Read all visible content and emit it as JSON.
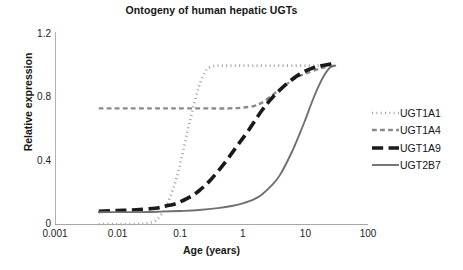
{
  "chart_data": {
    "type": "line",
    "title": "Ontogeny of human hepatic UGTs",
    "xlabel": "Age (years)",
    "ylabel": "Relative expression",
    "xscale": "log",
    "xlim": [
      0.001,
      100
    ],
    "ylim": [
      0,
      1.2
    ],
    "xticks": [
      "0.001",
      "0.01",
      "0.1",
      "1",
      "10",
      "100"
    ],
    "xtick_values": [
      0.001,
      0.01,
      0.1,
      1,
      10,
      100
    ],
    "yticks": [
      "0",
      "0.4",
      "0.8",
      "1.2"
    ],
    "ytick_values": [
      0,
      0.4,
      0.8,
      1.2
    ],
    "grid": false,
    "legend_position": "right",
    "series": [
      {
        "name": "UGT1A1",
        "style": "dotted",
        "color": "#a8a8a8",
        "width": 2.6,
        "x": [
          0.005,
          0.01,
          0.02,
          0.03,
          0.04,
          0.05,
          0.06,
          0.08,
          0.1,
          0.13,
          0.16,
          0.2,
          0.25,
          0.3,
          0.4,
          0.6,
          1,
          2,
          4,
          10,
          20,
          30
        ],
        "y": [
          0.0,
          0.0,
          0.0,
          0.005,
          0.02,
          0.06,
          0.11,
          0.24,
          0.38,
          0.58,
          0.73,
          0.87,
          0.96,
          0.99,
          1.0,
          1.0,
          1.0,
          1.0,
          1.0,
          1.0,
          1.0,
          1.0
        ]
      },
      {
        "name": "UGT1A4",
        "style": "dashed",
        "color": "#8a8a8a",
        "width": 2.4,
        "x": [
          0.005,
          0.01,
          0.05,
          0.1,
          0.3,
          0.6,
          1,
          1.5,
          2,
          3,
          4,
          6,
          8,
          10,
          15,
          20,
          30
        ],
        "y": [
          0.73,
          0.73,
          0.73,
          0.73,
          0.73,
          0.73,
          0.735,
          0.745,
          0.765,
          0.815,
          0.855,
          0.905,
          0.935,
          0.95,
          0.975,
          0.99,
          1.0
        ]
      },
      {
        "name": "UGT1A9",
        "style": "longdash",
        "color": "#1a1a1a",
        "width": 3.6,
        "x": [
          0.005,
          0.01,
          0.02,
          0.04,
          0.06,
          0.08,
          0.1,
          0.15,
          0.2,
          0.3,
          0.5,
          0.8,
          1.2,
          2,
          3,
          5,
          8,
          12,
          18,
          25,
          30
        ],
        "y": [
          0.08,
          0.085,
          0.09,
          0.1,
          0.115,
          0.125,
          0.14,
          0.175,
          0.21,
          0.275,
          0.38,
          0.49,
          0.585,
          0.715,
          0.8,
          0.885,
          0.945,
          0.98,
          1.0,
          1.01,
          1.015
        ]
      },
      {
        "name": "UGT2B7",
        "style": "solid",
        "color": "#707070",
        "width": 1.9,
        "x": [
          0.005,
          0.02,
          0.05,
          0.1,
          0.2,
          0.4,
          0.7,
          1,
          1.5,
          2,
          3,
          4,
          6,
          8,
          10,
          13,
          16,
          20,
          25,
          30
        ],
        "y": [
          0.075,
          0.075,
          0.078,
          0.082,
          0.088,
          0.1,
          0.115,
          0.13,
          0.155,
          0.185,
          0.25,
          0.315,
          0.45,
          0.565,
          0.66,
          0.78,
          0.865,
          0.94,
          0.99,
          1.0
        ]
      }
    ]
  },
  "legend": {
    "items": [
      {
        "label": "UGT1A1"
      },
      {
        "label": "UGT1A4"
      },
      {
        "label": "UGT1A9"
      },
      {
        "label": "UGT2B7"
      }
    ]
  }
}
